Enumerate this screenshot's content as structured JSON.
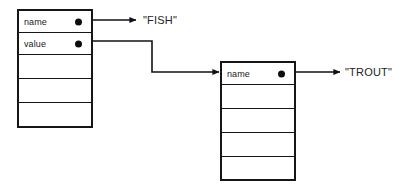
{
  "diagram": {
    "type": "record-pointer-diagram",
    "background_color": "#ffffff",
    "stroke_color": "#161616",
    "text_color": "#1a1a1a",
    "records": [
      {
        "id": "left-record",
        "row_count": 5,
        "rows": [
          {
            "label": "name",
            "has_pointer": true
          },
          {
            "label": "value",
            "has_pointer": true
          },
          {
            "label": "",
            "has_pointer": false
          },
          {
            "label": "",
            "has_pointer": false
          },
          {
            "label": "",
            "has_pointer": false
          }
        ]
      },
      {
        "id": "right-record",
        "row_count": 5,
        "rows": [
          {
            "label": "name",
            "has_pointer": true
          },
          {
            "label": "",
            "has_pointer": false
          },
          {
            "label": "",
            "has_pointer": false
          },
          {
            "label": "",
            "has_pointer": false
          },
          {
            "label": "",
            "has_pointer": false
          }
        ]
      }
    ],
    "values": [
      {
        "id": "fish-value",
        "text": "\"FISH\""
      },
      {
        "id": "trout-value",
        "text": "\"TROUT\""
      }
    ],
    "arrows": [
      {
        "id": "name-to-fish",
        "from": "left-record.name",
        "to": "fish-value",
        "style": "straight"
      },
      {
        "id": "value-to-record",
        "from": "left-record.value",
        "to": "right-record",
        "style": "elbow"
      },
      {
        "id": "name-to-trout",
        "from": "right-record.name",
        "to": "trout-value",
        "style": "straight"
      }
    ]
  }
}
